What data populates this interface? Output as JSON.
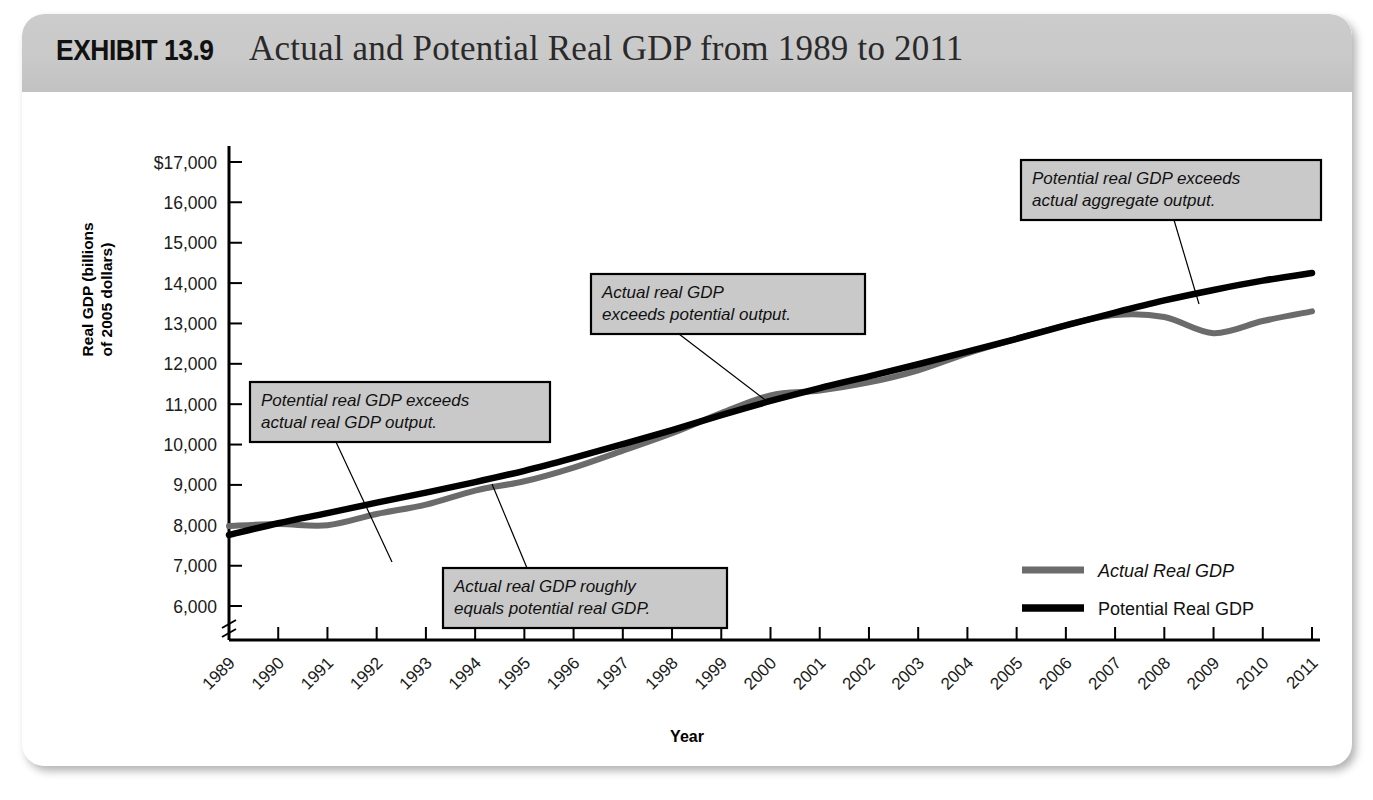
{
  "header": {
    "exhibit_label": "EXHIBIT 13.9",
    "title": "Actual and Potential Real GDP from 1989 to 2011"
  },
  "axes": {
    "ylabel_line1": "Real GDP (billions",
    "ylabel_line2": "of 2005 dollars)",
    "xlabel": "Year",
    "yticks": [
      "$17,000",
      "16,000",
      "15,000",
      "14,000",
      "13,000",
      "12,000",
      "11,000",
      "10,000",
      "9,000",
      "8,000",
      "7,000",
      "6,000"
    ],
    "xticks": [
      "1989",
      "1990",
      "1991",
      "1992",
      "1993",
      "1994",
      "1995",
      "1996",
      "1997",
      "1998",
      "1999",
      "2000",
      "2001",
      "2002",
      "2003",
      "2004",
      "2005",
      "2006",
      "2007",
      "2008",
      "2009",
      "2010",
      "2011"
    ],
    "axis_break": true
  },
  "legend": {
    "position": "inside-bottom-right",
    "items": [
      {
        "label": "Actual Real GDP",
        "color": "#6b6b6b",
        "style": "italic"
      },
      {
        "label": "Potential Real GDP",
        "color": "#000000",
        "style": "normal"
      }
    ]
  },
  "annotations": [
    {
      "id": "callout-potential-exceeds-actual-early",
      "lines": [
        "Potential real GDP exceeds",
        "actual real GDP output."
      ],
      "box": {
        "x": 228,
        "y": 290,
        "w": 300,
        "h": 60
      },
      "leader": [
        [
          314,
          350
        ],
        [
          370,
          470
        ]
      ]
    },
    {
      "id": "callout-actual-equals-potential",
      "lines": [
        "Actual real GDP roughly",
        "equals potential real GDP."
      ],
      "box": {
        "x": 421,
        "y": 476,
        "w": 284,
        "h": 60
      },
      "leader": [
        [
          505,
          476
        ],
        [
          470,
          392
        ]
      ]
    },
    {
      "id": "callout-actual-exceeds-potential",
      "lines": [
        "Actual real GDP",
        "exceeds potential output."
      ],
      "box": {
        "x": 569,
        "y": 182,
        "w": 274,
        "h": 60
      },
      "leader": [
        [
          657,
          242
        ],
        [
          746,
          310
        ]
      ]
    },
    {
      "id": "callout-potential-exceeds-actual-late",
      "lines": [
        "Potential real GDP exceeds",
        "actual aggregate output."
      ],
      "box": {
        "x": 999,
        "y": 68,
        "w": 300,
        "h": 60
      },
      "leader": [
        [
          1152,
          128
        ],
        [
          1177,
          212
        ]
      ]
    }
  ],
  "chart_data": {
    "type": "line",
    "title": "Actual and Potential Real GDP from 1989 to 2011",
    "xlabel": "Year",
    "ylabel": "Real GDP (billions of 2005 dollars)",
    "xlim": [
      1989,
      2011
    ],
    "ylim": [
      5600,
      17000
    ],
    "grid": false,
    "legend_position": "inside-bottom-right",
    "y_axis_break_below": 6000,
    "x": [
      1989,
      1990,
      1991,
      1992,
      1993,
      1994,
      1995,
      1996,
      1997,
      1998,
      1999,
      2000,
      2001,
      2002,
      2003,
      2004,
      2005,
      2006,
      2007,
      2008,
      2009,
      2010,
      2011
    ],
    "series": [
      {
        "name": "Actual Real GDP",
        "color": "#6b6b6b",
        "values": [
          7980,
          8030,
          8000,
          8280,
          8510,
          8860,
          9090,
          9430,
          9850,
          10280,
          10780,
          11220,
          11340,
          11540,
          11840,
          12260,
          12620,
          12960,
          13210,
          13160,
          12760,
          13060,
          13300
        ]
      },
      {
        "name": "Potential Real GDP",
        "color": "#000000",
        "values": [
          7760,
          8050,
          8300,
          8560,
          8810,
          9070,
          9350,
          9670,
          10010,
          10360,
          10730,
          11080,
          11400,
          11690,
          11990,
          12300,
          12620,
          12950,
          13270,
          13570,
          13830,
          14060,
          14250
        ]
      }
    ],
    "notes": [
      "Potential real GDP exceeds actual real GDP output.",
      "Actual real GDP roughly equals potential real GDP.",
      "Actual real GDP exceeds potential output.",
      "Potential real GDP exceeds actual aggregate output."
    ]
  }
}
